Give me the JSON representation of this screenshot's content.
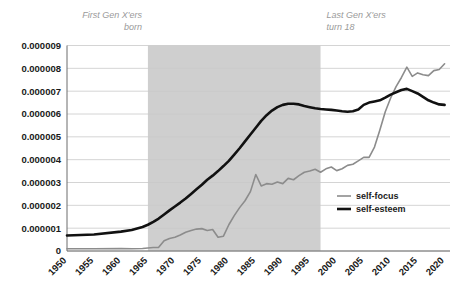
{
  "chart_data": {
    "type": "line",
    "title": "",
    "xlabel": "",
    "ylabel": "",
    "xlim": [
      1950,
      2021
    ],
    "ylim": [
      0,
      9e-06
    ],
    "grid": true,
    "legend_position": "inside-right",
    "y_tick_labels": [
      "0.000009",
      "0.000008",
      "0.000007",
      "0.000006",
      "0.000005",
      "0.000004",
      "0.000003",
      "0.000002",
      "0.000001",
      "0"
    ],
    "y_tick_values": [
      9e-06,
      8e-06,
      7e-06,
      6e-06,
      5e-06,
      4e-06,
      3e-06,
      2e-06,
      1e-06,
      0
    ],
    "x_tick_labels": [
      "1950",
      "1955",
      "1960",
      "1965",
      "1970",
      "1975",
      "1980",
      "1985",
      "1990",
      "1995",
      "2000",
      "2005",
      "2010",
      "2015",
      "2020"
    ],
    "x_tick_values": [
      1950,
      1955,
      1960,
      1965,
      1970,
      1975,
      1980,
      1985,
      1990,
      1995,
      2000,
      2005,
      2010,
      2015,
      2020
    ],
    "annotations": [
      {
        "name": "first-gen-x-born",
        "text_line1": "First Gen X'ers",
        "text_line2": "born",
        "align": "right",
        "x": 1965
      },
      {
        "name": "last-gen-x-turn-18",
        "text_line1": "Last Gen X'ers",
        "text_line2": "turn 18",
        "align": "left",
        "x": 1997
      }
    ],
    "shaded_region": {
      "name": "gen-x-band",
      "x_start": 1965,
      "x_end": 1997,
      "color": "#cfcfcf"
    },
    "series": [
      {
        "name": "self-focus",
        "color": "#8c8c8c",
        "width": 1.6,
        "x": [
          1950,
          1955,
          1960,
          1962,
          1964,
          1965,
          1966,
          1967,
          1968,
          1969,
          1970,
          1971,
          1972,
          1973,
          1974,
          1975,
          1976,
          1977,
          1978,
          1979,
          1980,
          1981,
          1982,
          1983,
          1984,
          1985,
          1986,
          1987,
          1988,
          1989,
          1990,
          1991,
          1992,
          1993,
          1994,
          1995,
          1996,
          1997,
          1998,
          1999,
          2000,
          2001,
          2002,
          2003,
          2004,
          2005,
          2006,
          2007,
          2008,
          2009,
          2010,
          2011,
          2012,
          2013,
          2014,
          2015,
          2016,
          2017,
          2018,
          2019,
          2020
        ],
        "y": [
          1e-07,
          1e-07,
          1.1e-07,
          1e-07,
          1.1e-07,
          1.3e-07,
          1.5e-07,
          1.6e-07,
          4.5e-07,
          5.5e-07,
          6e-07,
          7e-07,
          8.2e-07,
          9e-07,
          9.6e-07,
          9.8e-07,
          9e-07,
          9.4e-07,
          6e-07,
          6.5e-07,
          1.15e-06,
          1.55e-06,
          1.9e-06,
          2.2e-06,
          2.6e-06,
          3.35e-06,
          2.85e-06,
          2.95e-06,
          2.92e-06,
          3.02e-06,
          2.95e-06,
          3.18e-06,
          3.12e-06,
          3.3e-06,
          3.45e-06,
          3.5e-06,
          3.58e-06,
          3.45e-06,
          3.6e-06,
          3.68e-06,
          3.52e-06,
          3.6e-06,
          3.75e-06,
          3.8e-06,
          3.95e-06,
          4.1e-06,
          4.1e-06,
          4.55e-06,
          5.3e-06,
          6.1e-06,
          6.7e-06,
          7.2e-06,
          7.6e-06,
          8.05e-06,
          7.65e-06,
          7.8e-06,
          7.72e-06,
          7.68e-06,
          7.9e-06,
          7.95e-06,
          8.2e-06
        ]
      },
      {
        "name": "self-esteem",
        "color": "#111111",
        "width": 2.6,
        "x": [
          1950,
          1955,
          1960,
          1962,
          1964,
          1965,
          1966,
          1967,
          1968,
          1969,
          1970,
          1971,
          1972,
          1973,
          1974,
          1975,
          1976,
          1977,
          1978,
          1979,
          1980,
          1981,
          1982,
          1983,
          1984,
          1985,
          1986,
          1987,
          1988,
          1989,
          1990,
          1991,
          1992,
          1993,
          1994,
          1995,
          1996,
          1997,
          1998,
          1999,
          2000,
          2001,
          2002,
          2003,
          2004,
          2005,
          2006,
          2007,
          2008,
          2009,
          2010,
          2011,
          2012,
          2013,
          2014,
          2015,
          2016,
          2017,
          2018,
          2019,
          2020
        ],
        "y": [
          6.8e-07,
          7.2e-07,
          8.5e-07,
          9.2e-07,
          1.05e-06,
          1.15e-06,
          1.28e-06,
          1.42e-06,
          1.6e-06,
          1.78e-06,
          1.95e-06,
          2.12e-06,
          2.3e-06,
          2.5e-06,
          2.7e-06,
          2.9e-06,
          3.12e-06,
          3.3e-06,
          3.5e-06,
          3.72e-06,
          3.95e-06,
          4.22e-06,
          4.5e-06,
          4.8e-06,
          5.1e-06,
          5.4e-06,
          5.7e-06,
          5.95e-06,
          6.15e-06,
          6.3e-06,
          6.4e-06,
          6.45e-06,
          6.45e-06,
          6.42e-06,
          6.35e-06,
          6.3e-06,
          6.25e-06,
          6.22e-06,
          6.2e-06,
          6.18e-06,
          6.15e-06,
          6.12e-06,
          6.1e-06,
          6.12e-06,
          6.2e-06,
          6.4e-06,
          6.5e-06,
          6.55e-06,
          6.6e-06,
          6.72e-06,
          6.85e-06,
          6.95e-06,
          7.05e-06,
          7.1e-06,
          7e-06,
          6.9e-06,
          6.75e-06,
          6.6e-06,
          6.5e-06,
          6.42e-06,
          6.4e-06
        ]
      }
    ],
    "legend": [
      {
        "name": "self-focus",
        "label": "self-focus",
        "color": "#8c8c8c",
        "width": 1.6
      },
      {
        "name": "self-esteem",
        "label": "self-esteem",
        "color": "#111111",
        "width": 2.6
      }
    ]
  }
}
